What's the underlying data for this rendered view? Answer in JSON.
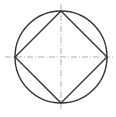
{
  "diagram": {
    "title": "",
    "circle": {
      "cx": 61,
      "cy": 57,
      "r": 46
    },
    "square_vertices": [
      [
        61,
        11
      ],
      [
        107,
        57
      ],
      [
        61,
        103
      ],
      [
        15,
        57
      ]
    ],
    "center_lines": {
      "horizontal": [
        5,
        113
      ],
      "vertical": [
        4,
        111
      ]
    },
    "colors": {
      "stroke": "#333333",
      "centerline": "#999999"
    }
  }
}
